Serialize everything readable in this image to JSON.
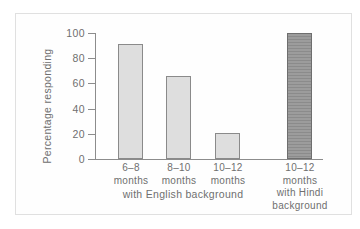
{
  "figure": {
    "ylabel": "Percentage responding",
    "group_label": "with English background"
  },
  "chart_data": {
    "type": "bar",
    "title": "",
    "xlabel": "",
    "ylabel": "Percentage responding",
    "ylim": [
      0,
      100
    ],
    "grid": false,
    "legend": "none",
    "yticks": [
      100,
      80,
      60,
      40,
      20,
      0
    ],
    "categories": [
      [
        "6–8",
        "months"
      ],
      [
        "8–10",
        "months"
      ],
      [
        "10–12",
        "months"
      ],
      [
        "10–12",
        "months",
        "with Hindi",
        "background"
      ]
    ],
    "category_flat_labels": [
      "6–8 months",
      "8–10 months",
      "10–12 months",
      "10–12 months with Hindi background"
    ],
    "values": [
      91,
      66,
      21,
      100
    ],
    "bar_styles": [
      "light",
      "light",
      "light",
      "dark"
    ],
    "group_annotation": "with English background",
    "colors": {
      "frame_border": "#e0e0e0",
      "panel_bg": "#fefefe",
      "axis_color": "#8c8c8c",
      "text_color": "#6f6f6f",
      "light_bar_fill": "#dedede",
      "light_bar_border": "#8a8a8a",
      "dark_bar_fill": "#9c9c9c",
      "dark_bar_stripe": "#8b8b8b",
      "dark_bar_border": "#6e6e6e"
    }
  }
}
